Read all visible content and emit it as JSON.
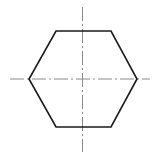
{
  "diagram": {
    "type": "technical-drawing",
    "shape": "regular-hexagon",
    "orientation": "flat-top",
    "center": [
      82.5,
      79
    ],
    "outline": {
      "color": "#1a1a1a",
      "stroke_width": 1.6,
      "vertices": [
        [
          56,
          31
        ],
        [
          111,
          31
        ],
        [
          137,
          79
        ],
        [
          111,
          127
        ],
        [
          56,
          127
        ],
        [
          29,
          79
        ]
      ]
    },
    "center_lines": {
      "color": "#8a8a8a",
      "stroke_width": 1,
      "dash_pattern": "14 3 2 3",
      "horizontal": {
        "x1": 10,
        "y1": 79,
        "x2": 150,
        "y2": 79
      },
      "vertical": {
        "x1": 82.5,
        "y1": 7,
        "x2": 82.5,
        "y2": 152
      }
    }
  }
}
